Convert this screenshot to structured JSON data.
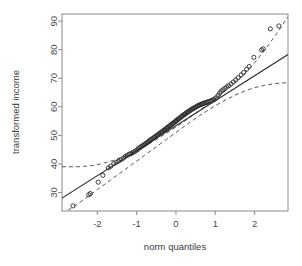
{
  "chart_data": {
    "type": "scatter",
    "title": "",
    "xlabel": "norm quantiles",
    "ylabel": "transformed income",
    "xlim": [
      -2.9,
      2.85
    ],
    "ylim": [
      23.5,
      92.5
    ],
    "xticks": [
      -2,
      -1,
      0,
      1,
      2
    ],
    "xtick_labels": [
      "-2",
      "-1",
      "0",
      "1",
      "2"
    ],
    "yticks": [
      30,
      40,
      50,
      60,
      70,
      80,
      90
    ],
    "ytick_labels": [
      "30",
      "40",
      "50",
      "60",
      "70",
      "80",
      "90"
    ],
    "grid": false,
    "legend": "none",
    "marker": "open-circle",
    "marker_color": "#2b2b2b",
    "line_color": "#2b2b2b",
    "band_style": "dashed",
    "points": [
      [
        -2.62,
        25.3
      ],
      [
        -2.22,
        29.2
      ],
      [
        -2.18,
        29.6
      ],
      [
        -1.98,
        33.6
      ],
      [
        -1.86,
        36.0
      ],
      [
        -1.72,
        38.6
      ],
      [
        -1.66,
        39.2
      ],
      [
        -1.58,
        40.1
      ],
      [
        -1.52,
        40.6
      ],
      [
        -1.46,
        41.0
      ],
      [
        -1.4,
        41.5
      ],
      [
        -1.34,
        42.0
      ],
      [
        -1.29,
        42.6
      ],
      [
        -1.24,
        43.0
      ],
      [
        -1.19,
        43.4
      ],
      [
        -1.15,
        43.6
      ],
      [
        -1.11,
        43.9
      ],
      [
        -1.07,
        44.2
      ],
      [
        -1.03,
        44.5
      ],
      [
        -0.99,
        44.9
      ],
      [
        -0.96,
        45.3
      ],
      [
        -0.92,
        45.7
      ],
      [
        -0.89,
        46.0
      ],
      [
        -0.86,
        46.3
      ],
      [
        -0.82,
        46.6
      ],
      [
        -0.79,
        46.9
      ],
      [
        -0.76,
        47.2
      ],
      [
        -0.73,
        47.5
      ],
      [
        -0.7,
        47.8
      ],
      [
        -0.67,
        48.1
      ],
      [
        -0.65,
        48.4
      ],
      [
        -0.62,
        48.6
      ],
      [
        -0.59,
        48.9
      ],
      [
        -0.56,
        49.2
      ],
      [
        -0.54,
        49.4
      ],
      [
        -0.51,
        49.7
      ],
      [
        -0.49,
        49.9
      ],
      [
        -0.46,
        50.2
      ],
      [
        -0.44,
        50.4
      ],
      [
        -0.41,
        50.7
      ],
      [
        -0.39,
        50.9
      ],
      [
        -0.36,
        51.2
      ],
      [
        -0.34,
        51.4
      ],
      [
        -0.31,
        51.7
      ],
      [
        -0.29,
        51.9
      ],
      [
        -0.27,
        52.2
      ],
      [
        -0.24,
        52.4
      ],
      [
        -0.22,
        52.7
      ],
      [
        -0.2,
        52.9
      ],
      [
        -0.17,
        53.2
      ],
      [
        -0.15,
        53.4
      ],
      [
        -0.13,
        53.7
      ],
      [
        -0.1,
        53.9
      ],
      [
        -0.08,
        54.2
      ],
      [
        -0.06,
        54.4
      ],
      [
        -0.03,
        54.7
      ],
      [
        -0.01,
        54.9
      ],
      [
        0.01,
        55.2
      ],
      [
        0.03,
        55.4
      ],
      [
        0.06,
        55.7
      ],
      [
        0.08,
        55.9
      ],
      [
        0.1,
        56.2
      ],
      [
        0.13,
        56.4
      ],
      [
        0.15,
        56.7
      ],
      [
        0.17,
        56.9
      ],
      [
        0.2,
        57.2
      ],
      [
        0.22,
        57.4
      ],
      [
        0.24,
        57.6
      ],
      [
        0.27,
        57.9
      ],
      [
        0.29,
        58.1
      ],
      [
        0.31,
        58.3
      ],
      [
        0.34,
        58.5
      ],
      [
        0.36,
        58.8
      ],
      [
        0.39,
        59.0
      ],
      [
        0.41,
        59.2
      ],
      [
        0.44,
        59.4
      ],
      [
        0.46,
        59.6
      ],
      [
        0.49,
        59.8
      ],
      [
        0.51,
        60.0
      ],
      [
        0.54,
        60.2
      ],
      [
        0.56,
        60.4
      ],
      [
        0.59,
        60.6
      ],
      [
        0.62,
        60.7
      ],
      [
        0.65,
        60.9
      ],
      [
        0.67,
        61.0
      ],
      [
        0.7,
        61.2
      ],
      [
        0.73,
        61.3
      ],
      [
        0.76,
        61.5
      ],
      [
        0.79,
        61.6
      ],
      [
        0.82,
        61.8
      ],
      [
        0.86,
        61.9
      ],
      [
        0.89,
        62.1
      ],
      [
        0.92,
        62.3
      ],
      [
        0.96,
        62.5
      ],
      [
        0.99,
        62.8
      ],
      [
        1.03,
        63.2
      ],
      [
        1.07,
        64.0
      ],
      [
        1.11,
        64.8
      ],
      [
        1.15,
        65.4
      ],
      [
        1.19,
        65.9
      ],
      [
        1.24,
        66.4
      ],
      [
        1.29,
        66.9
      ],
      [
        1.34,
        67.4
      ],
      [
        1.4,
        68.0
      ],
      [
        1.46,
        68.7
      ],
      [
        1.52,
        69.4
      ],
      [
        1.58,
        70.2
      ],
      [
        1.66,
        71.2
      ],
      [
        1.72,
        72.0
      ],
      [
        1.8,
        73.2
      ],
      [
        1.86,
        74.1
      ],
      [
        1.98,
        77.3
      ],
      [
        2.18,
        79.9
      ],
      [
        2.22,
        80.3
      ],
      [
        2.4,
        87.3
      ],
      [
        2.62,
        88.3
      ]
    ],
    "reference_line": {
      "x": [
        -2.9,
        2.85
      ],
      "y": [
        28.0,
        78.3
      ]
    },
    "upper_band": [
      [
        -2.9,
        39.0
      ],
      [
        -2.5,
        39.0
      ],
      [
        -2.2,
        39.3
      ],
      [
        -1.9,
        40.0
      ],
      [
        -1.6,
        41.2
      ],
      [
        -1.3,
        42.8
      ],
      [
        -1.0,
        44.7
      ],
      [
        -0.7,
        46.9
      ],
      [
        -0.4,
        49.4
      ],
      [
        -0.1,
        52.0
      ],
      [
        0.2,
        54.8
      ],
      [
        0.5,
        57.7
      ],
      [
        0.8,
        60.7
      ],
      [
        1.1,
        63.8
      ],
      [
        1.4,
        67.2
      ],
      [
        1.7,
        71.0
      ],
      [
        2.0,
        75.4
      ],
      [
        2.3,
        80.6
      ],
      [
        2.6,
        86.4
      ],
      [
        2.85,
        91.5
      ]
    ],
    "lower_band": [
      [
        -2.9,
        22.5
      ],
      [
        -2.6,
        25.0
      ],
      [
        -2.3,
        28.0
      ],
      [
        -2.0,
        31.0
      ],
      [
        -1.7,
        34.0
      ],
      [
        -1.4,
        37.0
      ],
      [
        -1.1,
        40.0
      ],
      [
        -0.8,
        43.0
      ],
      [
        -0.5,
        46.0
      ],
      [
        -0.2,
        49.0
      ],
      [
        0.1,
        52.0
      ],
      [
        0.4,
        55.0
      ],
      [
        0.7,
        57.8
      ],
      [
        1.0,
        60.4
      ],
      [
        1.3,
        62.7
      ],
      [
        1.6,
        64.7
      ],
      [
        1.9,
        66.3
      ],
      [
        2.2,
        67.4
      ],
      [
        2.5,
        68.1
      ],
      [
        2.85,
        68.5
      ]
    ]
  },
  "axis": {
    "x_title": "norm quantiles",
    "y_title": "transformed income"
  }
}
